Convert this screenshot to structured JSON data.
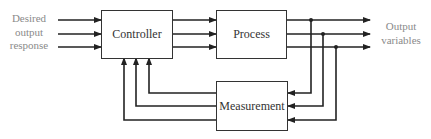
{
  "diagram": {
    "type": "block-diagram",
    "blocks": {
      "controller": "Controller",
      "process": "Process",
      "measurement": "Measurement"
    },
    "input_label": {
      "line1": "Desired",
      "line2": "output",
      "line3": "response"
    },
    "output_label": {
      "line1": "Output",
      "line2": "variables"
    },
    "edges": [
      {
        "from": "input",
        "to": "controller",
        "count": 3
      },
      {
        "from": "controller",
        "to": "process",
        "count": 3
      },
      {
        "from": "process",
        "to": "output",
        "count": 3
      },
      {
        "from": "process-output",
        "to": "measurement",
        "count": 3
      },
      {
        "from": "measurement",
        "to": "controller",
        "count": 3
      }
    ],
    "colors": {
      "line": "#222222",
      "block_border": "#333333",
      "label": "#8a8a8a"
    }
  }
}
